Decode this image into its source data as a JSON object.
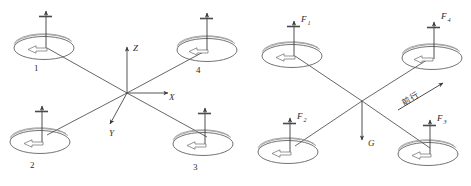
{
  "figure": {
    "background_color": "#ffffff",
    "line_color": "#4a4a4a",
    "text_color": "#2b2b2b",
    "panels": [
      {
        "id": "left",
        "caption": "",
        "rotor_labels": [
          "1",
          "2",
          "3",
          "4"
        ],
        "axis_labels": {
          "x": "X",
          "y": "Y",
          "z": "Z"
        }
      },
      {
        "id": "right",
        "caption": "",
        "force_labels": [
          "F",
          "F",
          "F",
          "F"
        ],
        "force_subscripts": [
          "1",
          "2",
          "3",
          "4"
        ],
        "gravity_label": "G",
        "direction_label": "前行"
      }
    ]
  },
  "left_panel": {
    "rotor1_label": "1",
    "rotor2_label": "2",
    "rotor3_label": "3",
    "rotor4_label": "4",
    "axis_x_label": "X",
    "axis_y_label": "Y",
    "axis_z_label": "Z"
  },
  "right_panel": {
    "f1_base": "F",
    "f1_sub": "1",
    "f2_base": "F",
    "f2_sub": "2",
    "f3_base": "F",
    "f3_sub": "3",
    "f4_base": "F",
    "f4_sub": "4",
    "gravity_label": "G",
    "direction_label": "前行"
  }
}
